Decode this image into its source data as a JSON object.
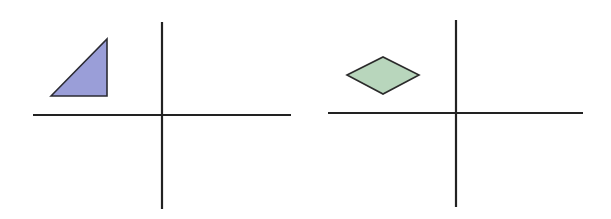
{
  "diagram": {
    "panels": [
      {
        "name": "left-coordinate-plane",
        "axes": {
          "x_line": [
            33,
            115,
            291,
            115
          ],
          "y_line": [
            162,
            22,
            162,
            209
          ]
        },
        "shape": {
          "type": "right-triangle",
          "quadrant": "II",
          "points": "51,96 107,39 107,96",
          "fill": "#9A9ED8",
          "stroke": "#2b2b33"
        }
      },
      {
        "name": "right-coordinate-plane",
        "axes": {
          "x_line": [
            328,
            113,
            583,
            113
          ],
          "y_line": [
            456,
            20,
            456,
            207
          ]
        },
        "shape": {
          "type": "rhombus",
          "quadrant": "II",
          "points": "347,75 383,57 419,75 383,94",
          "fill": "#B8D6BC",
          "stroke": "#2b2b2b"
        }
      }
    ],
    "axis_color": "#222222"
  }
}
